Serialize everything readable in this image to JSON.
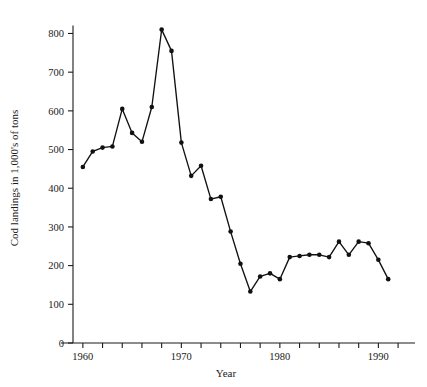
{
  "chart_data": {
    "type": "line",
    "title": "",
    "xlabel": "Year",
    "ylabel": "Cod landings in 1,000's of tons",
    "xlim": [
      1959,
      1992.5
    ],
    "ylim": [
      0,
      840
    ],
    "grid": false,
    "legend": null,
    "marker": "filled-circle",
    "x": [
      1960,
      1961,
      1962,
      1963,
      1964,
      1965,
      1966,
      1967,
      1968,
      1969,
      1970,
      1971,
      1972,
      1973,
      1974,
      1975,
      1976,
      1977,
      1978,
      1979,
      1980,
      1981,
      1982,
      1983,
      1984,
      1985,
      1986,
      1987,
      1988,
      1989,
      1990,
      1991
    ],
    "values": [
      455,
      495,
      505,
      508,
      605,
      543,
      520,
      610,
      810,
      755,
      518,
      432,
      458,
      372,
      378,
      288,
      205,
      133,
      172,
      180,
      165,
      222,
      225,
      228,
      228,
      222,
      262,
      228,
      262,
      258,
      215,
      165
    ],
    "y_ticks": [
      0,
      100,
      200,
      300,
      400,
      500,
      600,
      700,
      800
    ],
    "y_tick_labels": [
      "0",
      "100",
      "200",
      "300",
      "400",
      "500",
      "600",
      "700",
      "800"
    ],
    "x_ticks": [
      1960,
      1962,
      1964,
      1966,
      1968,
      1970,
      1972,
      1974,
      1976,
      1978,
      1980,
      1982,
      1984,
      1986,
      1988,
      1990,
      1992
    ],
    "x_tick_labeled": [
      1960,
      1970,
      1980,
      1990
    ],
    "x_tick_labels": [
      "1960",
      "1970",
      "1980",
      "1990"
    ],
    "colors": {
      "line": "#111111",
      "marker": "#111111",
      "axis": "#1a1a1a",
      "background": "#ffffff"
    }
  }
}
